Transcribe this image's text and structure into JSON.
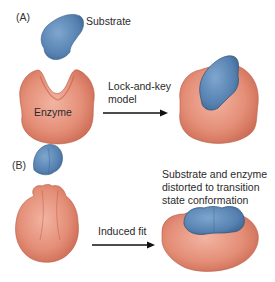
{
  "figure": {
    "panel_a": {
      "label": "(A)",
      "substrate_label": "Substrate",
      "enzyme_label": "Enzyme",
      "arrow_label_line1": "Lock-and-key",
      "arrow_label_line2": "model"
    },
    "panel_b": {
      "label": "(B)",
      "arrow_label": "Induced fit",
      "result_label_line1": "Substrate and enzyme",
      "result_label_line2": "distorted to transition",
      "result_label_line3": "state conformation"
    }
  },
  "colors": {
    "substrate": "#5b86b4",
    "substrate_dark": "#3f6994",
    "enzyme": "#e08a74",
    "enzyme_dark": "#c8654f",
    "arrow": "#111111"
  }
}
